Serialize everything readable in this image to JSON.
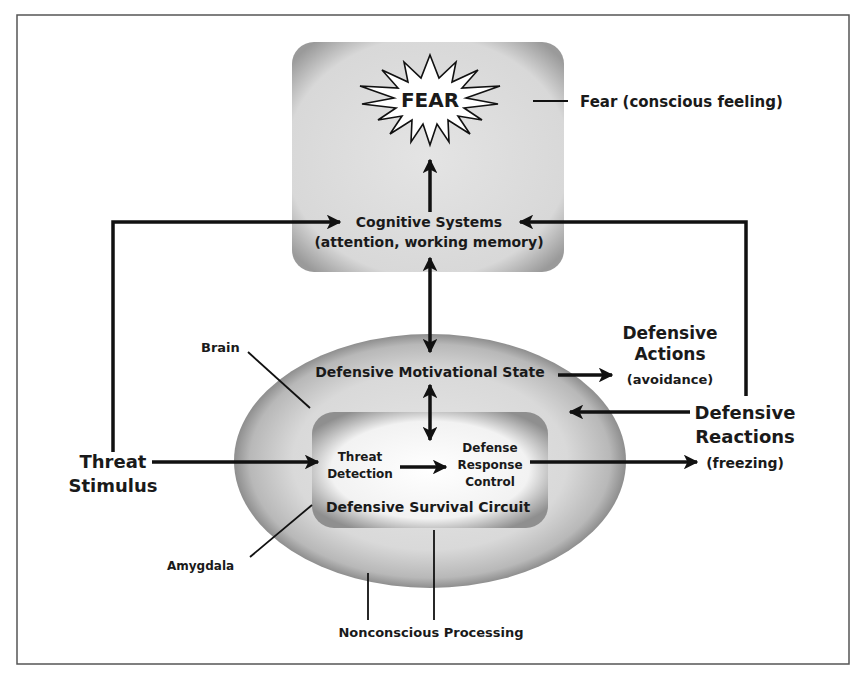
{
  "diagram": {
    "nodes": {
      "fear": {
        "label": "FEAR"
      },
      "fear_caption": {
        "label": "Fear (conscious feeling)"
      },
      "cognitive": {
        "line1": "Cognitive Systems",
        "line2": "(attention, working memory)"
      },
      "motivational": {
        "label": "Defensive Motivational State"
      },
      "threat_detection": {
        "line1": "Threat",
        "line2": "Detection"
      },
      "defense_response": {
        "line1": "Defense",
        "line2": "Response",
        "line3": "Control"
      },
      "survival_circuit": {
        "label": "Defensive Survival Circuit"
      },
      "threat_stimulus": {
        "line1": "Threat",
        "line2": "Stimulus"
      },
      "defensive_actions": {
        "line1": "Defensive",
        "line2": "Actions",
        "line3": "(avoidance)"
      },
      "defensive_reactions": {
        "line1": "Defensive",
        "line2": "Reactions",
        "line3": "(freezing)"
      }
    },
    "labels": {
      "brain": "Brain",
      "amygdala": "Amygdala",
      "nonconscious": "Nonconscious Processing"
    },
    "edges": [
      {
        "from": "threat_stimulus",
        "to": "cognitive"
      },
      {
        "from": "threat_stimulus",
        "to": "threat_detection"
      },
      {
        "from": "threat_detection",
        "to": "defense_response"
      },
      {
        "from": "defense_response",
        "to": "defensive_reactions"
      },
      {
        "from": "defensive_reactions",
        "to": "motivational"
      },
      {
        "from": "defensive_reactions",
        "to": "cognitive"
      },
      {
        "from": "motivational",
        "to": "defensive_actions"
      },
      {
        "from": "cognitive",
        "to": "fear"
      },
      {
        "from": "cognitive",
        "to": "motivational",
        "bidirectional": true
      },
      {
        "from": "motivational",
        "to": "defense_response",
        "bidirectional": true
      }
    ],
    "colors": {
      "frame": "#555555",
      "line": "#111111",
      "box_fill": "#d9d9d9",
      "box_shadow": "#8a8a8a",
      "ellipse_fill": "#dcdcdc"
    }
  }
}
